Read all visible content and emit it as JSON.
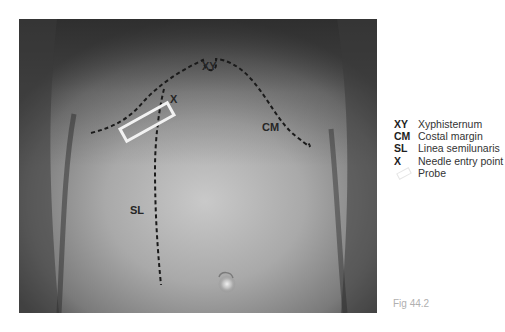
{
  "figure": {
    "caption": "Fig 44.2",
    "image_description": "Anterior abdomen photograph with surface landmarks marked for ultrasound-guided block",
    "annotations": {
      "xy": "XY",
      "cm": "CM",
      "sl": "SL",
      "x": "X"
    },
    "colors": {
      "line": "#1a1a1a",
      "probe": "#f2f2f2",
      "label": "#262626"
    }
  },
  "legend": {
    "items": [
      {
        "abbr": "XY",
        "label": "Xyphisternum"
      },
      {
        "abbr": "CM",
        "label": "Costal margin"
      },
      {
        "abbr": "SL",
        "label": "Linea semilunaris"
      },
      {
        "abbr": "X",
        "label": "Needle entry point"
      },
      {
        "abbr": "",
        "label": "Probe",
        "icon": "probe-outline-icon"
      }
    ]
  }
}
